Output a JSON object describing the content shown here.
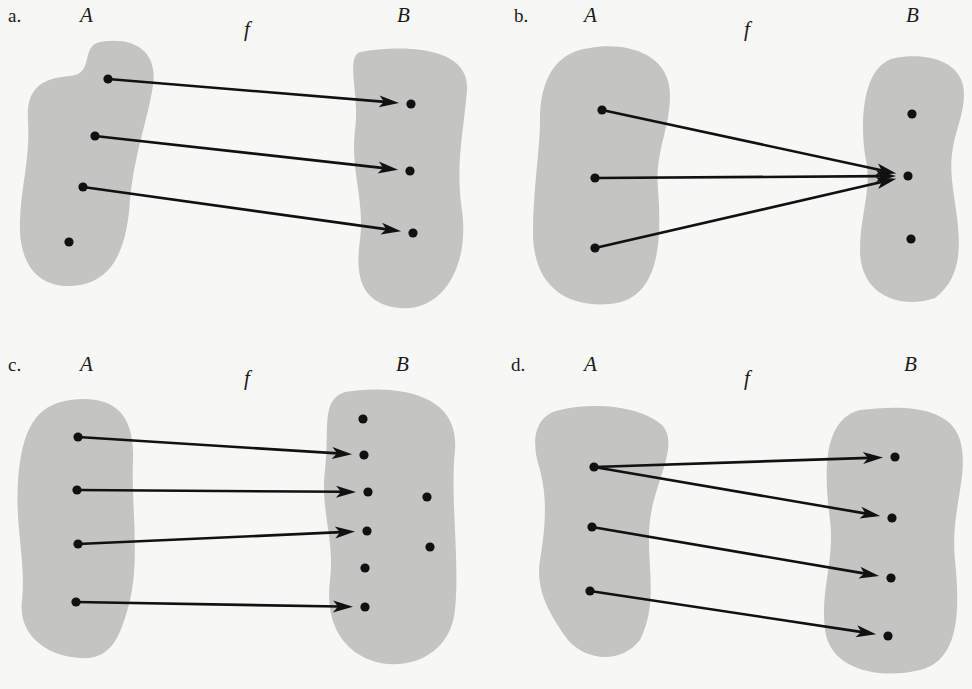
{
  "figure": {
    "background": "#f7f7f5",
    "blob_color": "#c4c4c2",
    "ink_color": "#111111",
    "panels": [
      {
        "id": "a",
        "letter": "a.",
        "domain_label": "A",
        "codomain_label": "B",
        "function_label": "f",
        "letter_pos": [
          8,
          22
        ],
        "domain_label_pos": [
          80,
          22
        ],
        "function_label_pos": [
          244,
          36
        ],
        "codomain_label_pos": [
          397,
          22
        ],
        "domain_blob": "M100,42 C135,36 158,52 153,85 C148,120 135,150 130,200 C127,250 112,285 70,286 C35,287 18,260 20,220 C22,180 30,160 28,120 C26,90 40,78 70,76 C95,74 80,46 100,42 Z",
        "codomain_blob": "M360,52 C400,45 470,45 467,90 C464,130 455,165 462,210 C470,270 440,312 400,308 C360,304 355,275 360,240 C365,200 350,170 355,130 C360,95 345,58 360,52 Z",
        "domain_points": [
          [
            108,
            79
          ],
          [
            95,
            136
          ],
          [
            83,
            187
          ],
          [
            69,
            242
          ]
        ],
        "codomain_points": [
          [
            411,
            104
          ],
          [
            410,
            171
          ],
          [
            413,
            233
          ]
        ],
        "mappings": [
          [
            0,
            0
          ],
          [
            1,
            1
          ],
          [
            2,
            2
          ]
        ],
        "description": "one-to-one but not onto-complete domain (one element of A unmapped)"
      },
      {
        "id": "b",
        "letter": "b.",
        "domain_label": "A",
        "codomain_label": "B",
        "function_label": "f",
        "letter_pos": [
          514,
          22
        ],
        "domain_label_pos": [
          584,
          22
        ],
        "function_label_pos": [
          744,
          36
        ],
        "codomain_label_pos": [
          906,
          22
        ],
        "domain_blob": "M590,48 C620,42 670,50 670,95 C670,130 655,150 658,190 C662,240 660,300 610,304 C560,308 532,280 533,230 C534,180 540,150 540,120 C540,80 555,52 590,48 Z",
        "codomain_blob": "M895,58 C925,52 965,60 964,95 C963,125 948,140 952,180 C956,220 972,270 935,298 C900,310 860,295 860,250 C860,215 872,190 866,160 C860,130 860,65 895,58 Z",
        "domain_points": [
          [
            602,
            110
          ],
          [
            595,
            178
          ],
          [
            595,
            248
          ]
        ],
        "codomain_points": [
          [
            912,
            114
          ],
          [
            908,
            176
          ],
          [
            911,
            239
          ]
        ],
        "mappings": [
          [
            0,
            1
          ],
          [
            1,
            1
          ],
          [
            2,
            1
          ]
        ],
        "description": "constant-like mapping, all elements of A map to same element of B"
      },
      {
        "id": "c",
        "letter": "c.",
        "domain_label": "A",
        "codomain_label": "B",
        "function_label": "f",
        "letter_pos": [
          8,
          371
        ],
        "domain_label_pos": [
          80,
          371
        ],
        "function_label_pos": [
          244,
          385
        ],
        "codomain_label_pos": [
          396,
          371
        ],
        "domain_blob": "M70,400 C110,395 135,410 133,460 C131,500 140,560 130,600 C120,640 110,660 80,658 C40,655 18,630 22,600 C26,560 15,530 18,480 C22,430 35,405 70,400 Z",
        "codomain_blob": "M345,392 C390,385 460,390 455,450 C450,500 460,560 455,610 C450,660 400,672 370,660 C340,648 325,620 330,580 C335,540 320,510 325,470 C330,430 320,400 345,392 Z",
        "domain_points": [
          [
            78,
            437
          ],
          [
            77,
            490
          ],
          [
            78,
            544
          ],
          [
            76,
            602
          ]
        ],
        "codomain_points": [
          [
            363,
            419
          ],
          [
            364,
            455
          ],
          [
            368,
            492
          ],
          [
            367,
            531
          ],
          [
            365,
            568
          ],
          [
            365,
            607
          ],
          [
            427,
            497
          ],
          [
            430,
            547
          ]
        ],
        "mappings": [
          [
            0,
            1
          ],
          [
            1,
            2
          ],
          [
            2,
            3
          ],
          [
            3,
            5
          ]
        ],
        "description": "one-to-one into B, several elements of B not in range"
      },
      {
        "id": "d",
        "letter": "d.",
        "domain_label": "A",
        "codomain_label": "B",
        "function_label": "f",
        "letter_pos": [
          511,
          371
        ],
        "domain_label_pos": [
          584,
          371
        ],
        "function_label_pos": [
          744,
          385
        ],
        "codomain_label_pos": [
          904,
          371
        ],
        "domain_blob": "M560,410 C590,402 640,405 662,425 C680,445 655,480 650,520 C645,560 660,600 640,640 C620,665 585,660 568,640 C550,615 535,590 540,560 C545,530 548,500 540,470 C530,440 535,415 560,410 Z",
        "codomain_blob": "M860,410 C900,405 950,405 960,440 C970,475 950,510 955,560 C960,610 960,660 920,670 C880,680 830,670 825,630 C820,590 835,560 830,520 C825,480 820,420 860,410 Z",
        "domain_points": [
          [
            594,
            467
          ],
          [
            592,
            527
          ],
          [
            590,
            591
          ]
        ],
        "codomain_points": [
          [
            895,
            457
          ],
          [
            892,
            518
          ],
          [
            891,
            578
          ],
          [
            888,
            636
          ]
        ],
        "mappings": [
          [
            0,
            0
          ],
          [
            0,
            1
          ],
          [
            1,
            2
          ],
          [
            2,
            3
          ]
        ],
        "description": "not a function: one element of A maps to two elements of B"
      }
    ]
  }
}
